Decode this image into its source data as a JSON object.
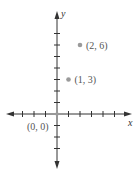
{
  "chart_data": {
    "type": "scatter",
    "title": "",
    "xlabel": "x",
    "ylabel": "y",
    "origin_label": "(0, 0)",
    "xlim": [
      -4,
      6
    ],
    "ylim": [
      -4,
      8
    ],
    "grid": false,
    "x_ticks": [
      -3,
      -2,
      -1,
      1,
      2,
      3,
      4,
      5
    ],
    "y_ticks": [
      -3,
      -2,
      -1,
      1,
      2,
      3,
      4,
      5,
      6,
      7
    ],
    "points": [
      {
        "x": 1,
        "y": 3,
        "label": "(1, 3)"
      },
      {
        "x": 2,
        "y": 6,
        "label": "(2, 6)"
      }
    ],
    "colors": {
      "axis": "#333333",
      "point": "#9a9a9a",
      "label": "#555555"
    }
  }
}
